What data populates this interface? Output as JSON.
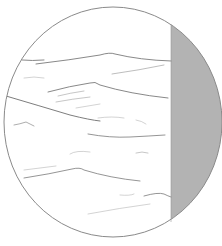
{
  "illustration": {
    "subject": "waves-in-circle",
    "colors": {
      "background": "#ffffff",
      "outline": "#8a8a8a",
      "wave_stroke": "#7a7a7a",
      "wave_stroke_light": "#b5b5b5",
      "shadow_fill": "#b3b3b3"
    },
    "circle": {
      "cx": 113,
      "cy": 122,
      "rx": 109,
      "ry": 115
    },
    "shadow": {
      "x_start": 171
    }
  }
}
